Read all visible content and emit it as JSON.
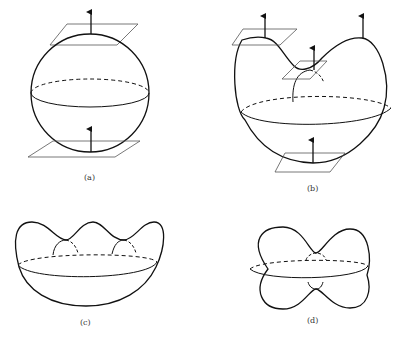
{
  "figure": {
    "panels": [
      {
        "id": "a",
        "label": "(a)",
        "shape": "sphere",
        "normals": 2,
        "tangent_planes": 2
      },
      {
        "id": "b",
        "label": "(b)",
        "shape": "heart-shaped surface with saddle",
        "normals": 4,
        "tangent_planes": 3
      },
      {
        "id": "c",
        "label": "(c)",
        "shape": "bowl with three bumps",
        "normals": 0,
        "tangent_planes": 0
      },
      {
        "id": "d",
        "label": "(d)",
        "shape": "peanut-shaped surface",
        "normals": 0,
        "tangent_planes": 0
      }
    ],
    "colors": {
      "stroke": "#111111",
      "plane": "#555555",
      "background": "#ffffff"
    }
  }
}
